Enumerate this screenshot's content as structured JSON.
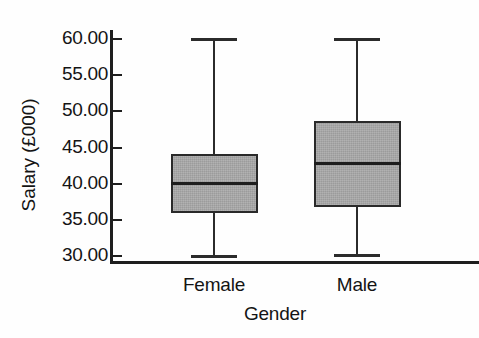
{
  "chart_data": {
    "type": "box",
    "title": "",
    "xlabel": "Gender",
    "ylabel": "Salary (£000)",
    "categories": [
      "Female",
      "Male"
    ],
    "ylim": [
      30.0,
      60.0
    ],
    "yticks": [
      60.0,
      55.0,
      50.0,
      45.0,
      40.0,
      35.0,
      30.0
    ],
    "ytick_labels": [
      "60.00",
      "55.00",
      "50.00",
      "45.00",
      "40.00",
      "35.00",
      "30.00"
    ],
    "grid": false,
    "legend": null,
    "boxes": [
      {
        "category": "Female",
        "whisker_low": 30.0,
        "q1": 35.8,
        "median": 39.9,
        "q3": 44.0,
        "whisker_high": 60.0
      },
      {
        "category": "Male",
        "whisker_low": 30.1,
        "q1": 36.7,
        "median": 42.7,
        "q3": 48.5,
        "whisker_high": 60.0
      }
    ],
    "box_fill_color": "#a9a9a9",
    "box_edge_color": "#2a2a2a",
    "axis_color": "#1e1e1e"
  },
  "axes": {
    "y_title": "Salary (£000)",
    "x_title": "Gender"
  }
}
